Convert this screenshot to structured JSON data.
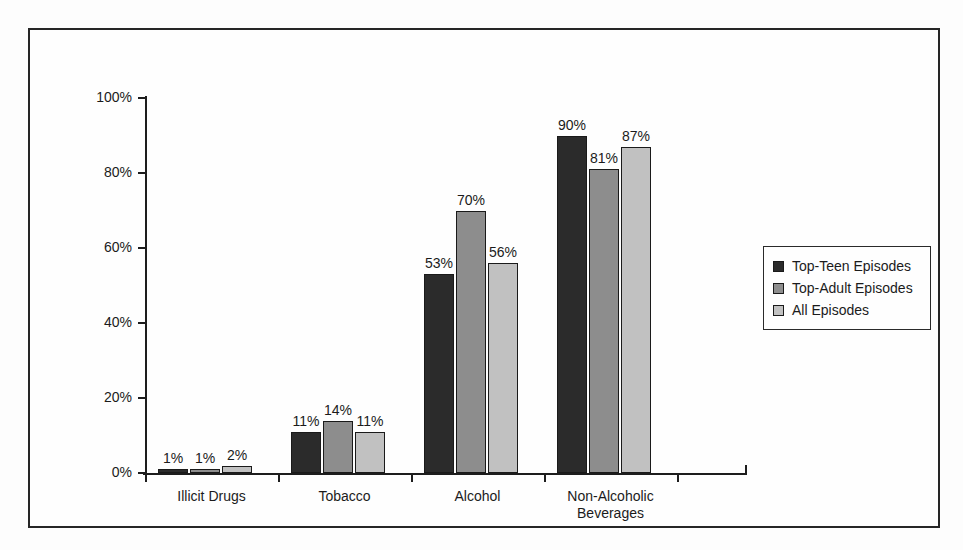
{
  "chart_data": {
    "type": "bar",
    "title": "",
    "xlabel": "",
    "ylabel": "",
    "ylim": [
      0,
      100
    ],
    "ytick_labels": [
      "0%",
      "20%",
      "40%",
      "60%",
      "80%",
      "100%"
    ],
    "ytick_values": [
      0,
      20,
      40,
      60,
      80,
      100
    ],
    "grid": false,
    "legend_position": "right",
    "categories": [
      "Illicit Drugs",
      "Tobacco",
      "Alcohol",
      "Non-Alcoholic Beverages"
    ],
    "category_label_lines": [
      [
        "Illicit Drugs"
      ],
      [
        "Tobacco"
      ],
      [
        "Alcohol"
      ],
      [
        "Non-Alcoholic",
        "Beverages"
      ]
    ],
    "series": [
      {
        "name": "Top-Teen Episodes",
        "color": "#2b2b2b",
        "values": [
          1,
          11,
          53,
          90
        ],
        "value_labels": [
          "1%",
          "11%",
          "53%",
          "90%"
        ]
      },
      {
        "name": "Top-Adult Episodes",
        "color": "#8d8d8d",
        "values": [
          1,
          14,
          70,
          81
        ],
        "value_labels": [
          "1%",
          "14%",
          "70%",
          "81%"
        ]
      },
      {
        "name": "All Episodes",
        "color": "#c1c1c1",
        "values": [
          2,
          11,
          56,
          87
        ],
        "value_labels": [
          "2%",
          "11%",
          "56%",
          "87%"
        ]
      }
    ]
  }
}
